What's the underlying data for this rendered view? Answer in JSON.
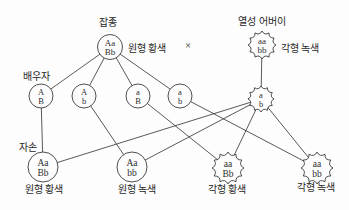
{
  "diagram": {
    "title_context": "dihybrid-test-cross-genetics-diagram",
    "labels": {
      "hybrid": "잡종",
      "recessive_parent": "열성 어버이",
      "gametes": "배우자",
      "offspring": "자손",
      "cross_symbol": "×"
    },
    "parent_hybrid": {
      "genotype1": "Aa",
      "genotype2": "Bb",
      "phenotype": "원형 황색",
      "shape": "circle"
    },
    "parent_recessive": {
      "genotype1": "aa",
      "genotype2": "bb",
      "phenotype": "각형 녹색",
      "shape": "spiky"
    },
    "gamete_list": [
      {
        "g1": "A",
        "g2": "B",
        "shape": "circle"
      },
      {
        "g1": "A",
        "g2": "b",
        "shape": "circle"
      },
      {
        "g1": "a",
        "g2": "B",
        "shape": "circle"
      },
      {
        "g1": "a",
        "g2": "b",
        "shape": "circle"
      },
      {
        "g1": "a",
        "g2": "b",
        "shape": "spiky"
      }
    ],
    "offspring_list": [
      {
        "g1": "Aa",
        "g2": "Bb",
        "phenotype": "원형 황색",
        "shape": "circle"
      },
      {
        "g1": "Aa",
        "g2": "bb",
        "phenotype": "원형 녹색",
        "shape": "circle"
      },
      {
        "g1": "aa",
        "g2": "Bb",
        "phenotype": "각형 황색",
        "shape": "spiky"
      },
      {
        "g1": "aa",
        "g2": "bb",
        "phenotype": "각형 녹색",
        "shape": "spiky"
      }
    ],
    "colors": {
      "line": "#3b3b3b",
      "text": "#262626",
      "background": "#fdfdfd"
    }
  }
}
